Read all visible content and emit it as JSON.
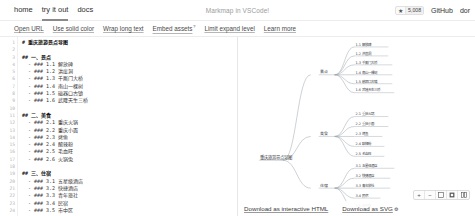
{
  "header": {
    "nav": [
      {
        "label": "home",
        "active": false
      },
      {
        "label": "try it out",
        "active": true
      },
      {
        "label": "docs",
        "active": false
      }
    ],
    "title": "Markmap in VSCode!",
    "star_icon": "star-icon",
    "star_count": "5,008",
    "links": [
      {
        "label": "GitHub"
      },
      {
        "label": "dor"
      }
    ]
  },
  "toolbar": {
    "links": [
      {
        "label": "Open URL",
        "sup": ""
      },
      {
        "label": "Use solid color",
        "sup": ""
      },
      {
        "label": "Wrap long text",
        "sup": ""
      },
      {
        "label": "Embed assets",
        "sup": "?"
      },
      {
        "label": "Limit expand level",
        "sup": ""
      },
      {
        "label": "Learn more",
        "sup": ""
      }
    ]
  },
  "editor": {
    "lines": [
      {
        "n": "1",
        "text": "# 重庆旅游景点导图"
      },
      {
        "n": "2",
        "text": ""
      },
      {
        "n": "3",
        "text": "## 一、景点"
      },
      {
        "n": "4",
        "text": "  - ### 1.1 解放碑"
      },
      {
        "n": "5",
        "text": "  - ### 1.2 洪崖洞"
      },
      {
        "n": "6",
        "text": "  - ### 1.3 千厮门大桥"
      },
      {
        "n": "7",
        "text": "  - ### 1.4 南山一棵树"
      },
      {
        "n": "8",
        "text": "  - ### 1.5 磁器口古镇"
      },
      {
        "n": "9",
        "text": "  - ### 1.6 武隆天生三桥"
      },
      {
        "n": "10",
        "text": ""
      },
      {
        "n": "11",
        "text": "## 二、美食"
      },
      {
        "n": "12",
        "text": "  - ### 2.1 重庆火锅"
      },
      {
        "n": "13",
        "text": "  - ### 2.2 重庆小面"
      },
      {
        "n": "14",
        "text": "  - ### 2.3 烤鱼"
      },
      {
        "n": "15",
        "text": "  - ### 2.4 酸辣粉"
      },
      {
        "n": "16",
        "text": "  - ### 2.5 毛血旺"
      },
      {
        "n": "17",
        "text": "  - ### 2.6 火锅兔"
      },
      {
        "n": "18",
        "text": ""
      },
      {
        "n": "19",
        "text": "## 三、住宿"
      },
      {
        "n": "20",
        "text": "  - ### 3.1 五星级酒店"
      },
      {
        "n": "21",
        "text": "  - ### 3.2 快捷酒店"
      },
      {
        "n": "22",
        "text": "  - ### 3.3 青年旅社"
      },
      {
        "n": "23",
        "text": "  - ### 3.4 民宿"
      },
      {
        "n": "24",
        "text": "  - ### 3.5 市中区"
      }
    ]
  },
  "mindmap": {
    "root": "重庆旅游景点导图",
    "branches": [
      {
        "label": "景点",
        "leaves": [
          "1.1 解放碑",
          "1.2 洪崖洞",
          "1.3 千厮门大桥",
          "1.4 南山一棵树",
          "1.5 磁器口古镇",
          "1.6 武隆天生三桥"
        ]
      },
      {
        "label": "美食",
        "leaves": [
          "2.1 重庆火锅",
          "2.2 重庆小面",
          "2.3 烤鱼",
          "2.4 酸辣粉",
          "2.5 毛血旺"
        ]
      },
      {
        "label": "住宿",
        "leaves": [
          "3.1 五星级酒店",
          "3.2 快捷酒店",
          "3.3 青年旅社",
          "3.4 民宿",
          "3.5 市中区"
        ]
      }
    ]
  },
  "map_footer": {
    "download_html": "Download as interactive HTML",
    "download_svg": "Download as SVG"
  },
  "map_toolbar": {
    "zoom_in": "+",
    "zoom_out": "−",
    "fit": "fit-icon",
    "expand": "expand-icon",
    "collapse": "collapse-icon"
  }
}
